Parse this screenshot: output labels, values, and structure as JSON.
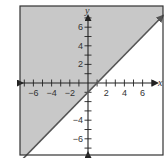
{
  "chart_data": {
    "type": "inequality-graph",
    "title": "",
    "xlabel": "x",
    "ylabel": "y",
    "xlim": [
      -7.5,
      8
    ],
    "ylim": [
      -7.8,
      8.3
    ],
    "x_ticks": [
      -7,
      -6,
      -5,
      -4,
      -3,
      -2,
      -1,
      1,
      2,
      3,
      4,
      5,
      6,
      7
    ],
    "y_ticks": [
      -7,
      -6,
      -5,
      -4,
      -3,
      -2,
      -1,
      1,
      2,
      3,
      4,
      5,
      6,
      7
    ],
    "x_tick_labels": [
      "-6",
      "-4",
      "-2",
      "2",
      "4",
      "6"
    ],
    "x_tick_label_values": [
      -6,
      -4,
      -2,
      2,
      4,
      6
    ],
    "y_tick_labels": [
      "6",
      "4",
      "2",
      "-4",
      "-6"
    ],
    "y_tick_label_values": [
      6,
      4,
      2,
      -4,
      -6
    ],
    "grid": false,
    "boundary_line": {
      "equation": "y = x - 1",
      "slope": 1,
      "intercept": -1,
      "style": "solid",
      "points": [
        [
          -7.3,
          -8.3
        ],
        [
          8.2,
          7.2
        ]
      ]
    },
    "shaded_region": "above-left of line",
    "inequality": "y ≥ x - 1",
    "colors": {
      "shade": "#c8c8c8",
      "line": "#555555",
      "axes": "#222222",
      "border": "#333333"
    }
  }
}
